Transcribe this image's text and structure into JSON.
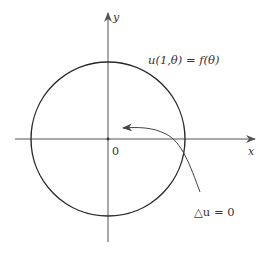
{
  "diagram": {
    "type": "unit-disk-dirichlet-problem",
    "axes": {
      "x_label": "x",
      "y_label": "y",
      "origin_label": "0"
    },
    "circle": {
      "description": "unit circle boundary",
      "stroke_color": "#2a2a2a"
    },
    "annotations": {
      "boundary_condition": "u(1,θ) = f(θ)",
      "interior_equation": "△u = 0"
    },
    "colors": {
      "axis": "#555555",
      "circle": "#2a2a2a",
      "arrow": "#444444",
      "text": "#333333",
      "background": "#ffffff"
    }
  }
}
